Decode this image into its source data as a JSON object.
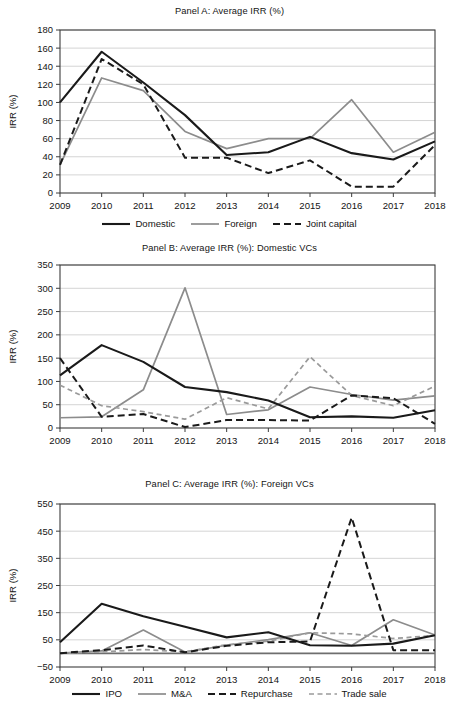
{
  "figure": {
    "width": 459,
    "height": 712,
    "background": "#ffffff"
  },
  "colors": {
    "solid_dark": "#1a1a1a",
    "solid_grey": "#8c8c8c",
    "dashed_dark": "#1a1a1a",
    "dashed_grey": "#9a9a9a",
    "grid": "#c9c9c9",
    "axis": "#3c3c3c",
    "text": "#141414"
  },
  "panels": [
    {
      "id": "A",
      "title": "Panel A: Average IRR (%)",
      "ylabel": "IRR (%)",
      "legend": [
        {
          "label": "Domestic",
          "style": "solid",
          "color": "#1a1a1a",
          "width": 2.1
        },
        {
          "label": "Foreign",
          "style": "solid",
          "color": "#8c8c8c",
          "width": 1.7
        },
        {
          "label": "Joint capital",
          "style": "dashed",
          "color": "#1a1a1a",
          "width": 2.0
        }
      ]
    },
    {
      "id": "B",
      "title": "Panel B: Average IRR (%): Domestic VCs",
      "ylabel": "IRR (%)",
      "legend": [
        {
          "label": "IPO",
          "style": "solid",
          "color": "#1a1a1a",
          "width": 2.1
        },
        {
          "label": "M&A",
          "style": "solid",
          "color": "#8c8c8c",
          "width": 1.7
        },
        {
          "label": "Repurchase",
          "style": "dashed",
          "color": "#1a1a1a",
          "width": 2.0
        },
        {
          "label": "Trade sale",
          "style": "dashed",
          "color": "#9a9a9a",
          "width": 1.7
        }
      ]
    },
    {
      "id": "C",
      "title": "Panel C: Average IRR (%): Foreign VCs",
      "ylabel": "IRR (%)",
      "legend": [
        {
          "label": "IPO",
          "style": "solid",
          "color": "#1a1a1a",
          "width": 2.1
        },
        {
          "label": "M&A",
          "style": "solid",
          "color": "#8c8c8c",
          "width": 1.7
        },
        {
          "label": "Repurchase",
          "style": "dashed",
          "color": "#1a1a1a",
          "width": 2.0
        },
        {
          "label": "Trade sale",
          "style": "dashed",
          "color": "#9a9a9a",
          "width": 1.7
        }
      ]
    }
  ],
  "chart_data": [
    {
      "type": "line",
      "panel": "A",
      "title": "Panel A: Average IRR (%)",
      "xlabel": "",
      "ylabel": "IRR (%)",
      "categories": [
        "2009",
        "2010",
        "2011",
        "2012",
        "2013",
        "2014",
        "2015",
        "2016",
        "2017",
        "2018"
      ],
      "ylim": [
        0,
        180
      ],
      "yticks": [
        0,
        20,
        40,
        60,
        80,
        100,
        120,
        140,
        160,
        180
      ],
      "grid": true,
      "legend_position": "bottom",
      "series": [
        {
          "name": "Domestic",
          "style": "solid",
          "color": "#1a1a1a",
          "values": [
            100,
            156,
            122,
            86,
            42,
            45,
            62,
            44,
            37,
            57
          ]
        },
        {
          "name": "Foreign",
          "style": "solid",
          "color": "#8c8c8c",
          "values": [
            31,
            127,
            113,
            68,
            49,
            60,
            60,
            103,
            45,
            67
          ]
        },
        {
          "name": "Joint capital",
          "style": "dashed",
          "color": "#1a1a1a",
          "values": [
            31,
            148,
            120,
            39,
            39,
            22,
            36,
            7,
            7,
            53
          ]
        }
      ]
    },
    {
      "type": "line",
      "panel": "B",
      "title": "Panel B: Average IRR (%): Domestic VCs",
      "xlabel": "",
      "ylabel": "IRR (%)",
      "categories": [
        "2009",
        "2010",
        "2011",
        "2012",
        "2013",
        "2014",
        "2015",
        "2016",
        "2017",
        "2018"
      ],
      "ylim": [
        0,
        350
      ],
      "yticks": [
        0,
        50,
        100,
        150,
        200,
        250,
        300,
        350
      ],
      "grid": true,
      "legend_position": "bottom",
      "series": [
        {
          "name": "IPO",
          "style": "solid",
          "color": "#1a1a1a",
          "values": [
            113,
            178,
            142,
            88,
            77,
            59,
            23,
            25,
            22,
            38
          ]
        },
        {
          "name": "M&A",
          "style": "solid",
          "color": "#8c8c8c",
          "values": [
            22,
            24,
            82,
            301,
            29,
            39,
            88,
            72,
            60,
            69
          ]
        },
        {
          "name": "Repurchase",
          "style": "dashed",
          "color": "#1a1a1a",
          "values": [
            150,
            24,
            30,
            2,
            17,
            17,
            16,
            70,
            64,
            9
          ]
        },
        {
          "name": "Trade sale",
          "style": "dashed",
          "color": "#9a9a9a",
          "values": [
            92,
            48,
            35,
            19,
            65,
            41,
            153,
            70,
            48,
            90
          ]
        }
      ]
    },
    {
      "type": "line",
      "panel": "C",
      "title": "Panel C: Average IRR (%): Foreign VCs",
      "xlabel": "",
      "ylabel": "IRR (%)",
      "categories": [
        "2009",
        "2010",
        "2011",
        "2012",
        "2013",
        "2014",
        "2015",
        "2016",
        "2017",
        "2018"
      ],
      "ylim": [
        -50,
        550
      ],
      "yticks": [
        -50,
        50,
        150,
        250,
        350,
        450,
        550
      ],
      "grid": true,
      "legend_position": "bottom",
      "series": [
        {
          "name": "IPO",
          "style": "solid",
          "color": "#1a1a1a",
          "values": [
            41,
            183,
            137,
            98,
            59,
            78,
            30,
            28,
            36,
            67
          ]
        },
        {
          "name": "M&A",
          "style": "solid",
          "color": "#8c8c8c",
          "values": [
            1,
            9,
            86,
            5,
            30,
            51,
            76,
            29,
            124,
            68
          ]
        },
        {
          "name": "Repurchase",
          "style": "dashed",
          "color": "#1a1a1a",
          "values": [
            1,
            12,
            29,
            4,
            28,
            41,
            44,
            500,
            12,
            12
          ]
        },
        {
          "name": "Trade sale",
          "style": "dashed",
          "color": "#9a9a9a",
          "values": [
            0,
            6,
            14,
            6,
            32,
            45,
            76,
            72,
            55,
            66
          ]
        }
      ]
    }
  ]
}
